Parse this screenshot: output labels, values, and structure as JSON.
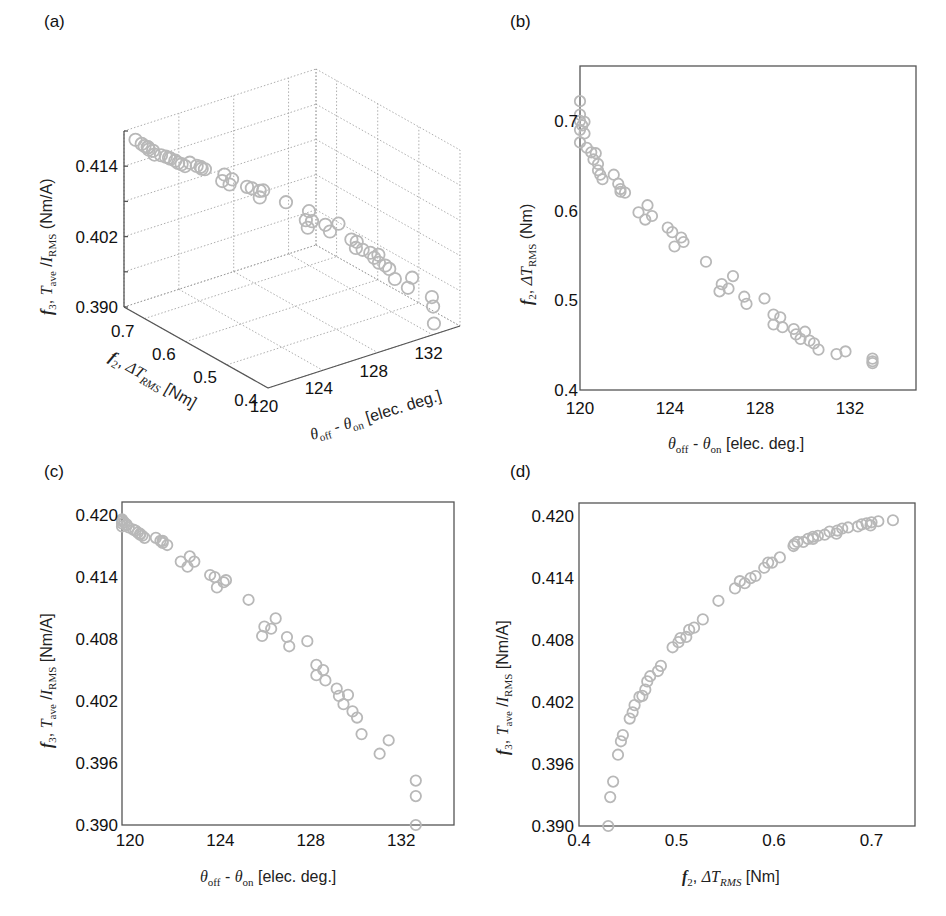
{
  "figure": {
    "panels": [
      {
        "id": "a",
        "label": "(a)"
      },
      {
        "id": "b",
        "label": "(b)"
      },
      {
        "id": "c",
        "label": "(c)"
      },
      {
        "id": "d",
        "label": "(d)"
      }
    ],
    "marker_color": "#b8b8b8",
    "axis_color": "#555555"
  },
  "labels": {
    "theta_axis": {
      "theta": "θ",
      "off": "off",
      "dash": " - ",
      "on": "on",
      "unit": " [elec. deg.]"
    },
    "f2_axis_a": {
      "f": "f",
      "sub": "2",
      "comma": ", ",
      "delta": "ΔT",
      "rms": "RMS",
      "unit": " [Nm]"
    },
    "f2_axis_b": {
      "f": "f",
      "sub": "2",
      "comma": ", ",
      "delta": "ΔT",
      "rms": "RMS",
      "unit": " (Nm)"
    },
    "f3_axis_a": {
      "f": "f",
      "sub": "3",
      "comma": ", ",
      "T": "T",
      "ave": "ave",
      "slash": " /",
      "I": "I",
      "rms": "RMS",
      "unit": " (Nm/A)"
    },
    "f3_axis_c": {
      "f": "f",
      "sub": "3",
      "comma": ", ",
      "T": "T",
      "ave": "ave",
      "slash": " /",
      "I": "I",
      "rms": "RMS",
      "unit": " [Nm/A]"
    }
  },
  "chart_data": [
    {
      "panel": "(a)",
      "type": "scatter",
      "projection": "3d",
      "title": "",
      "xlabel": "θoff - θon [elec. deg.]",
      "ylabel": "f2, ΔT_RMS [Nm]",
      "zlabel": "f3, T_ave / I_RMS (Nm/A)",
      "x_ticks": [
        "120",
        "124",
        "128",
        "132"
      ],
      "y_ticks": [
        "0.7",
        "0.6",
        "0.5",
        "0.4"
      ],
      "z_ticks": [
        "0.390",
        "0.402",
        "0.414"
      ],
      "xlim": [
        120,
        134
      ],
      "ylim": [
        0.4,
        0.75
      ],
      "zlim": [
        0.39,
        0.42
      ],
      "grid": true,
      "marker": "open circle",
      "series_ref": "points"
    },
    {
      "panel": "(b)",
      "type": "scatter",
      "title": "",
      "xlabel": "θoff - θon [elec. deg.]",
      "ylabel": "f2, ΔT_RMS (Nm)",
      "x_ticks": [
        "120",
        "124",
        "128",
        "132"
      ],
      "y_ticks": [
        "0.4",
        "0.5",
        "0.6",
        "0.7"
      ],
      "xlim": [
        120,
        135
      ],
      "ylim": [
        0.4,
        0.76
      ],
      "grid": false,
      "x_key": "theta",
      "y_key": "f2"
    },
    {
      "panel": "(c)",
      "type": "scatter",
      "title": "",
      "xlabel": "θoff - θon [elec. deg.]",
      "ylabel": "f3, T_ave / I_RMS [Nm/A]",
      "x_ticks": [
        "120",
        "124",
        "128",
        "132"
      ],
      "y_ticks": [
        "0.390",
        "0.396",
        "0.402",
        "0.408",
        "0.414",
        "0.420"
      ],
      "xlim": [
        120,
        134.7
      ],
      "ylim": [
        0.39,
        0.4213
      ],
      "grid": false,
      "x_key": "theta",
      "y_key": "f3"
    },
    {
      "panel": "(d)",
      "type": "scatter",
      "title": "",
      "xlabel": "f2, ΔT_RMS [Nm]",
      "ylabel": "f3, T_ave / I_RMS [Nm/A]",
      "x_ticks": [
        "0.4",
        "0.5",
        "0.6",
        "0.7"
      ],
      "y_ticks": [
        "0.390",
        "0.396",
        "0.402",
        "0.408",
        "0.414",
        "0.420"
      ],
      "xlim": [
        0.4,
        0.74
      ],
      "ylim": [
        0.39,
        0.4213
      ],
      "grid": false,
      "x_key": "f2",
      "y_key": "f3"
    }
  ],
  "points": [
    {
      "theta": 120.0,
      "f2": 0.722,
      "f3": 0.4196
    },
    {
      "theta": 120.0,
      "f2": 0.707,
      "f3": 0.4195
    },
    {
      "theta": 120.0,
      "f2": 0.7,
      "f3": 0.4194
    },
    {
      "theta": 120.1,
      "f2": 0.695,
      "f3": 0.4193
    },
    {
      "theta": 120.0,
      "f2": 0.69,
      "f3": 0.4192
    },
    {
      "theta": 120.2,
      "f2": 0.699,
      "f3": 0.4191
    },
    {
      "theta": 120.2,
      "f2": 0.686,
      "f3": 0.419
    },
    {
      "theta": 120.0,
      "f2": 0.676,
      "f3": 0.4189
    },
    {
      "theta": 120.3,
      "f2": 0.67,
      "f3": 0.4188
    },
    {
      "theta": 120.5,
      "f2": 0.665,
      "f3": 0.4186
    },
    {
      "theta": 120.6,
      "f2": 0.657,
      "f3": 0.4185
    },
    {
      "theta": 120.7,
      "f2": 0.664,
      "f3": 0.4183
    },
    {
      "theta": 120.8,
      "f2": 0.652,
      "f3": 0.4182
    },
    {
      "theta": 120.8,
      "f2": 0.645,
      "f3": 0.4181
    },
    {
      "theta": 120.9,
      "f2": 0.64,
      "f3": 0.418
    },
    {
      "theta": 121.0,
      "f2": 0.635,
      "f3": 0.4178
    },
    {
      "theta": 121.5,
      "f2": 0.64,
      "f3": 0.4178
    },
    {
      "theta": 121.7,
      "f2": 0.63,
      "f3": 0.4175
    },
    {
      "theta": 121.8,
      "f2": 0.624,
      "f3": 0.4175
    },
    {
      "theta": 121.8,
      "f2": 0.621,
      "f3": 0.4173
    },
    {
      "theta": 122.0,
      "f2": 0.62,
      "f3": 0.4171
    },
    {
      "theta": 122.6,
      "f2": 0.598,
      "f3": 0.4155
    },
    {
      "theta": 122.9,
      "f2": 0.59,
      "f3": 0.415
    },
    {
      "theta": 123.0,
      "f2": 0.606,
      "f3": 0.416
    },
    {
      "theta": 123.2,
      "f2": 0.594,
      "f3": 0.4155
    },
    {
      "theta": 123.9,
      "f2": 0.581,
      "f3": 0.4142
    },
    {
      "theta": 124.2,
      "f2": 0.56,
      "f3": 0.413
    },
    {
      "theta": 124.1,
      "f2": 0.576,
      "f3": 0.414
    },
    {
      "theta": 124.5,
      "f2": 0.57,
      "f3": 0.4135
    },
    {
      "theta": 124.6,
      "f2": 0.565,
      "f3": 0.4137
    },
    {
      "theta": 125.6,
      "f2": 0.543,
      "f3": 0.4118
    },
    {
      "theta": 126.2,
      "f2": 0.51,
      "f3": 0.4083
    },
    {
      "theta": 126.3,
      "f2": 0.518,
      "f3": 0.4092
    },
    {
      "theta": 126.6,
      "f2": 0.513,
      "f3": 0.409
    },
    {
      "theta": 126.8,
      "f2": 0.527,
      "f3": 0.41
    },
    {
      "theta": 127.3,
      "f2": 0.504,
      "f3": 0.4082
    },
    {
      "theta": 127.4,
      "f2": 0.496,
      "f3": 0.4073
    },
    {
      "theta": 128.2,
      "f2": 0.502,
      "f3": 0.4078
    },
    {
      "theta": 128.6,
      "f2": 0.484,
      "f3": 0.4055
    },
    {
      "theta": 128.6,
      "f2": 0.473,
      "f3": 0.4045
    },
    {
      "theta": 128.9,
      "f2": 0.481,
      "f3": 0.405
    },
    {
      "theta": 129.0,
      "f2": 0.47,
      "f3": 0.404
    },
    {
      "theta": 129.5,
      "f2": 0.468,
      "f3": 0.4032
    },
    {
      "theta": 129.6,
      "f2": 0.462,
      "f3": 0.4025
    },
    {
      "theta": 129.8,
      "f2": 0.457,
      "f3": 0.4017
    },
    {
      "theta": 130.0,
      "f2": 0.465,
      "f3": 0.4026
    },
    {
      "theta": 130.2,
      "f2": 0.455,
      "f3": 0.401
    },
    {
      "theta": 130.4,
      "f2": 0.452,
      "f3": 0.4004
    },
    {
      "theta": 130.6,
      "f2": 0.445,
      "f3": 0.3988
    },
    {
      "theta": 131.4,
      "f2": 0.44,
      "f3": 0.3969
    },
    {
      "theta": 131.8,
      "f2": 0.443,
      "f3": 0.3982
    },
    {
      "theta": 133.0,
      "f2": 0.435,
      "f3": 0.3943
    },
    {
      "theta": 133.0,
      "f2": 0.432,
      "f3": 0.3928
    },
    {
      "theta": 133.0,
      "f2": 0.43,
      "f3": 0.39
    }
  ]
}
